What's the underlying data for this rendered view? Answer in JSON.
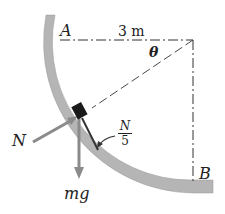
{
  "diagram": {
    "labels": {
      "point_a": "A",
      "point_b": "B",
      "radius": "3 m",
      "angle": "θ",
      "normal_force": "N",
      "friction_numerator": "N",
      "friction_denominator": "5",
      "weight": "mg"
    },
    "colors": {
      "track": "#b5b5b5",
      "ink": "#222222",
      "force_arrow": "#8a8a8a",
      "block": "#1a1a1a"
    }
  }
}
